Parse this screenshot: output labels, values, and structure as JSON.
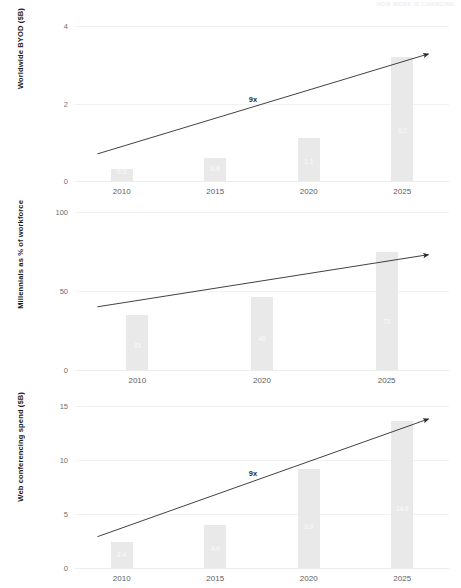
{
  "header": {
    "note": "HOW WORK IS CHANGING"
  },
  "charts": [
    {
      "id": "byod",
      "ylabel": "Worldwide BYOD ($B)",
      "yticks": [
        "0",
        "2",
        "4"
      ],
      "ytick_values": [
        0,
        2,
        4
      ],
      "ylim": [
        0,
        4
      ],
      "categories": [
        "2010",
        "2015",
        "2020",
        "2025"
      ],
      "values": [
        0.3,
        0.6,
        1.1,
        3.2
      ],
      "value_labels": [
        "0.3",
        "0.6",
        "1.1",
        "3.2"
      ],
      "annotation": "9x",
      "arrow": {
        "x0": 0.06,
        "y0": 0.7,
        "x1": 0.945,
        "y1": 3.28
      }
    },
    {
      "id": "millennials",
      "ylabel": "Millennials as % of workforce",
      "yticks": [
        "0",
        "50",
        "100"
      ],
      "ytick_values": [
        0,
        50,
        100
      ],
      "ylim": [
        0,
        100
      ],
      "categories": [
        "2010",
        "2020",
        "2025"
      ],
      "values": [
        35,
        46,
        75
      ],
      "value_labels": [
        "35",
        "46",
        "75"
      ],
      "annotation": "",
      "arrow": {
        "x0": 0.06,
        "y0": 40,
        "x1": 0.945,
        "y1": 73
      }
    },
    {
      "id": "webconf",
      "ylabel": "Web conferencing spend ($B)",
      "yticks": [
        "0",
        "5",
        "10",
        "15"
      ],
      "ytick_values": [
        0,
        5,
        10,
        15
      ],
      "ylim": [
        0,
        15
      ],
      "categories": [
        "2010",
        "2015",
        "2020",
        "2025"
      ],
      "values": [
        2.4,
        4.0,
        9.2,
        13.6
      ],
      "value_labels": [
        "2.4",
        "4.0",
        "9.0",
        "14.0"
      ],
      "annotation": "9x",
      "arrow": {
        "x0": 0.06,
        "y0": 2.9,
        "x1": 0.945,
        "y1": 13.8
      }
    }
  ],
  "chart_data": [
    {
      "type": "bar",
      "title": "",
      "xlabel": "",
      "ylabel": "Worldwide BYOD ($B)",
      "categories": [
        "2010",
        "2015",
        "2020",
        "2025"
      ],
      "values": [
        0.3,
        0.6,
        1.1,
        3.2
      ],
      "ylim": [
        0,
        4
      ],
      "yticks": [
        0,
        2,
        4
      ],
      "grid": true,
      "legend": "none",
      "annotations": [
        "9x"
      ]
    },
    {
      "type": "bar",
      "title": "",
      "xlabel": "",
      "ylabel": "Millennials as % of workforce",
      "categories": [
        "2010",
        "2020",
        "2025"
      ],
      "values": [
        35,
        46,
        75
      ],
      "ylim": [
        0,
        100
      ],
      "yticks": [
        0,
        50,
        100
      ],
      "grid": true,
      "legend": "none",
      "annotations": []
    },
    {
      "type": "bar",
      "title": "",
      "xlabel": "",
      "ylabel": "Web conferencing spend ($B)",
      "categories": [
        "2010",
        "2015",
        "2020",
        "2025"
      ],
      "values": [
        2.4,
        4.0,
        9.2,
        13.6
      ],
      "ylim": [
        0,
        15
      ],
      "yticks": [
        0,
        5,
        10,
        15
      ],
      "grid": true,
      "legend": "none",
      "annotations": [
        "9x"
      ]
    }
  ],
  "colors": {
    "bar": "#e9e9e9",
    "grid": "#f2f2f2",
    "arrow": "#2b2b2b",
    "tick_text": "#5d5d5d",
    "axis_title": "#1c1c1c",
    "value_label": "#f6f6f6"
  }
}
